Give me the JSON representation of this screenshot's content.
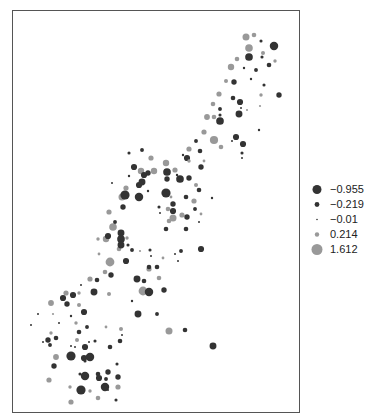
{
  "title": "",
  "colors": {
    "negative": "#333333",
    "positive": "#999999",
    "border": "#555555"
  },
  "chart_data": {
    "type": "scatter",
    "title": "",
    "subtitle": "",
    "xlabel": "",
    "ylabel": "",
    "grid": false,
    "legend_position": "right",
    "legend": [
      {
        "label": "−0.955",
        "value": -0.955,
        "r": 4.5,
        "color": "#333333"
      },
      {
        "label": "−0.219",
        "value": -0.219,
        "r": 2.4,
        "color": "#333333"
      },
      {
        "label": "−0.01",
        "value": -0.01,
        "r": 0.8,
        "color": "#333333"
      },
      {
        "label": "0.214",
        "value": 0.214,
        "r": 2.2,
        "color": "#999999"
      },
      {
        "label": "1.612",
        "value": 1.612,
        "r": 5.5,
        "color": "#999999"
      }
    ],
    "points": [
      {
        "x": 245,
        "y": 36,
        "v": 0.9
      },
      {
        "x": 253,
        "y": 34,
        "v": 0.5
      },
      {
        "x": 260,
        "y": 40,
        "v": -0.2
      },
      {
        "x": 273,
        "y": 45,
        "v": -0.9
      },
      {
        "x": 248,
        "y": 47,
        "v": 1.0
      },
      {
        "x": 262,
        "y": 52,
        "v": 0.4
      },
      {
        "x": 236,
        "y": 58,
        "v": 0.5
      },
      {
        "x": 248,
        "y": 56,
        "v": -0.8
      },
      {
        "x": 261,
        "y": 56,
        "v": -0.2
      },
      {
        "x": 274,
        "y": 60,
        "v": 0.3
      },
      {
        "x": 230,
        "y": 66,
        "v": 0.8
      },
      {
        "x": 243,
        "y": 67,
        "v": -0.1
      },
      {
        "x": 255,
        "y": 69,
        "v": -0.3
      },
      {
        "x": 268,
        "y": 64,
        "v": -0.4
      },
      {
        "x": 225,
        "y": 80,
        "v": 0.4
      },
      {
        "x": 233,
        "y": 81,
        "v": -0.5
      },
      {
        "x": 250,
        "y": 78,
        "v": -0.1
      },
      {
        "x": 263,
        "y": 84,
        "v": -0.2
      },
      {
        "x": 218,
        "y": 93,
        "v": 0.6
      },
      {
        "x": 232,
        "y": 97,
        "v": -0.4
      },
      {
        "x": 260,
        "y": 94,
        "v": 0.3
      },
      {
        "x": 278,
        "y": 94,
        "v": -0.5
      },
      {
        "x": 212,
        "y": 103,
        "v": 0.5
      },
      {
        "x": 219,
        "y": 108,
        "v": -0.3
      },
      {
        "x": 239,
        "y": 101,
        "v": -0.6
      },
      {
        "x": 259,
        "y": 105,
        "v": 0.1
      },
      {
        "x": 206,
        "y": 116,
        "v": 0.7
      },
      {
        "x": 213,
        "y": 116,
        "v": 0.5
      },
      {
        "x": 219,
        "y": 114,
        "v": -0.2
      },
      {
        "x": 219,
        "y": 120,
        "v": -0.8
      },
      {
        "x": 238,
        "y": 113,
        "v": -0.7
      },
      {
        "x": 240,
        "y": 107,
        "v": -0.05
      },
      {
        "x": 246,
        "y": 109,
        "v": 0.1
      },
      {
        "x": 203,
        "y": 131,
        "v": 0.6
      },
      {
        "x": 213,
        "y": 139,
        "v": 1.1
      },
      {
        "x": 220,
        "y": 146,
        "v": 0.5
      },
      {
        "x": 235,
        "y": 136,
        "v": -0.6
      },
      {
        "x": 231,
        "y": 140,
        "v": -0.05
      },
      {
        "x": 242,
        "y": 143,
        "v": -0.6
      },
      {
        "x": 258,
        "y": 129,
        "v": -0.1
      },
      {
        "x": 199,
        "y": 150,
        "v": -0.4
      },
      {
        "x": 203,
        "y": 160,
        "v": 0.2
      },
      {
        "x": 200,
        "y": 166,
        "v": -0.5
      },
      {
        "x": 241,
        "y": 152,
        "v": -0.2
      },
      {
        "x": 241,
        "y": 157,
        "v": -0.05
      },
      {
        "x": 195,
        "y": 140,
        "v": -0.3
      },
      {
        "x": 188,
        "y": 148,
        "v": 0.6
      },
      {
        "x": 186,
        "y": 157,
        "v": -0.6
      },
      {
        "x": 182,
        "y": 154,
        "v": -0.1
      },
      {
        "x": 165,
        "y": 162,
        "v": 0.8
      },
      {
        "x": 174,
        "y": 169,
        "v": 0.6
      },
      {
        "x": 176,
        "y": 174,
        "v": -0.1
      },
      {
        "x": 179,
        "y": 178,
        "v": -0.8
      },
      {
        "x": 188,
        "y": 177,
        "v": -0.5
      },
      {
        "x": 141,
        "y": 149,
        "v": -0.3
      },
      {
        "x": 150,
        "y": 157,
        "v": 0.6
      },
      {
        "x": 128,
        "y": 152,
        "v": -0.2
      },
      {
        "x": 133,
        "y": 166,
        "v": -0.6
      },
      {
        "x": 140,
        "y": 170,
        "v": 0.8
      },
      {
        "x": 153,
        "y": 170,
        "v": 0.8
      },
      {
        "x": 147,
        "y": 172,
        "v": -0.5
      },
      {
        "x": 143,
        "y": 174,
        "v": -0.6
      },
      {
        "x": 166,
        "y": 171,
        "v": -0.8
      },
      {
        "x": 188,
        "y": 160,
        "v": 0.3
      },
      {
        "x": 195,
        "y": 184,
        "v": 0.4
      },
      {
        "x": 198,
        "y": 189,
        "v": -0.4
      },
      {
        "x": 125,
        "y": 187,
        "v": 0.6
      },
      {
        "x": 138,
        "y": 184,
        "v": -0.6
      },
      {
        "x": 141,
        "y": 181,
        "v": -0.7
      },
      {
        "x": 166,
        "y": 178,
        "v": -0.5
      },
      {
        "x": 165,
        "y": 192,
        "v": -1.0
      },
      {
        "x": 128,
        "y": 175,
        "v": -0.1
      },
      {
        "x": 111,
        "y": 182,
        "v": -0.05
      },
      {
        "x": 121,
        "y": 196,
        "v": 0.9
      },
      {
        "x": 124,
        "y": 194,
        "v": -1.0
      },
      {
        "x": 147,
        "y": 190,
        "v": -0.1
      },
      {
        "x": 138,
        "y": 196,
        "v": -0.9
      },
      {
        "x": 170,
        "y": 196,
        "v": 0.2
      },
      {
        "x": 172,
        "y": 203,
        "v": -0.5
      },
      {
        "x": 185,
        "y": 196,
        "v": -0.4
      },
      {
        "x": 193,
        "y": 200,
        "v": 0.6
      },
      {
        "x": 194,
        "y": 208,
        "v": -0.3
      },
      {
        "x": 211,
        "y": 197,
        "v": -0.1
      },
      {
        "x": 200,
        "y": 213,
        "v": 0.2
      },
      {
        "x": 181,
        "y": 214,
        "v": 0.6
      },
      {
        "x": 186,
        "y": 216,
        "v": -0.5
      },
      {
        "x": 168,
        "y": 220,
        "v": 0.5
      },
      {
        "x": 165,
        "y": 228,
        "v": -0.4
      },
      {
        "x": 185,
        "y": 228,
        "v": -0.4
      },
      {
        "x": 198,
        "y": 221,
        "v": -0.05
      },
      {
        "x": 108,
        "y": 211,
        "v": 0.6
      },
      {
        "x": 122,
        "y": 206,
        "v": -0.5
      },
      {
        "x": 112,
        "y": 226,
        "v": 1.0
      },
      {
        "x": 114,
        "y": 221,
        "v": -0.3
      },
      {
        "x": 120,
        "y": 232,
        "v": -0.7
      },
      {
        "x": 126,
        "y": 237,
        "v": 0.3
      },
      {
        "x": 158,
        "y": 206,
        "v": -0.2
      },
      {
        "x": 159,
        "y": 212,
        "v": -0.05
      },
      {
        "x": 167,
        "y": 208,
        "v": 0.5
      },
      {
        "x": 172,
        "y": 210,
        "v": -0.6
      },
      {
        "x": 172,
        "y": 217,
        "v": 0.9
      },
      {
        "x": 105,
        "y": 238,
        "v": 0.8
      },
      {
        "x": 107,
        "y": 235,
        "v": -0.6
      },
      {
        "x": 120,
        "y": 238,
        "v": -0.8
      },
      {
        "x": 127,
        "y": 244,
        "v": -0.2
      },
      {
        "x": 97,
        "y": 238,
        "v": 0.3
      },
      {
        "x": 118,
        "y": 248,
        "v": 0.5
      },
      {
        "x": 131,
        "y": 249,
        "v": -0.3
      },
      {
        "x": 139,
        "y": 250,
        "v": 0.1
      },
      {
        "x": 149,
        "y": 249,
        "v": -0.2
      },
      {
        "x": 98,
        "y": 253,
        "v": 0.2
      },
      {
        "x": 120,
        "y": 244,
        "v": -0.7
      },
      {
        "x": 109,
        "y": 261,
        "v": 1.2
      },
      {
        "x": 125,
        "y": 260,
        "v": -0.6
      },
      {
        "x": 150,
        "y": 255,
        "v": -0.05
      },
      {
        "x": 162,
        "y": 257,
        "v": 0.2
      },
      {
        "x": 174,
        "y": 253,
        "v": -0.05
      },
      {
        "x": 180,
        "y": 250,
        "v": -0.3
      },
      {
        "x": 156,
        "y": 266,
        "v": -0.4
      },
      {
        "x": 148,
        "y": 268,
        "v": 0.6
      },
      {
        "x": 177,
        "y": 260,
        "v": -0.05
      },
      {
        "x": 200,
        "y": 248,
        "v": -0.6
      },
      {
        "x": 148,
        "y": 266,
        "v": -0.4
      },
      {
        "x": 104,
        "y": 271,
        "v": 0.5
      },
      {
        "x": 89,
        "y": 278,
        "v": 0.6
      },
      {
        "x": 96,
        "y": 279,
        "v": -0.4
      },
      {
        "x": 80,
        "y": 284,
        "v": -0.05
      },
      {
        "x": 110,
        "y": 274,
        "v": -0.5
      },
      {
        "x": 136,
        "y": 278,
        "v": -0.7
      },
      {
        "x": 142,
        "y": 290,
        "v": 1.2
      },
      {
        "x": 148,
        "y": 291,
        "v": -0.9
      },
      {
        "x": 163,
        "y": 289,
        "v": -0.5
      },
      {
        "x": 158,
        "y": 277,
        "v": 0.5
      },
      {
        "x": 143,
        "y": 280,
        "v": -0.4
      },
      {
        "x": 65,
        "y": 292,
        "v": 0.6
      },
      {
        "x": 72,
        "y": 294,
        "v": -0.6
      },
      {
        "x": 78,
        "y": 292,
        "v": 0.3
      },
      {
        "x": 66,
        "y": 303,
        "v": -0.5
      },
      {
        "x": 78,
        "y": 304,
        "v": 0.4
      },
      {
        "x": 83,
        "y": 311,
        "v": -0.6
      },
      {
        "x": 93,
        "y": 291,
        "v": -0.7
      },
      {
        "x": 108,
        "y": 293,
        "v": 0.4
      },
      {
        "x": 50,
        "y": 302,
        "v": 0.7
      },
      {
        "x": 62,
        "y": 297,
        "v": -0.6
      },
      {
        "x": 52,
        "y": 313,
        "v": 0.1
      },
      {
        "x": 58,
        "y": 322,
        "v": -0.05
      },
      {
        "x": 70,
        "y": 315,
        "v": -0.1
      },
      {
        "x": 75,
        "y": 322,
        "v": 0.3
      },
      {
        "x": 86,
        "y": 326,
        "v": -0.3
      },
      {
        "x": 78,
        "y": 331,
        "v": -0.4
      },
      {
        "x": 50,
        "y": 332,
        "v": 0.3
      },
      {
        "x": 105,
        "y": 326,
        "v": 0.2
      },
      {
        "x": 120,
        "y": 328,
        "v": 0.4
      },
      {
        "x": 137,
        "y": 313,
        "v": -0.7
      },
      {
        "x": 156,
        "y": 313,
        "v": -0.3
      },
      {
        "x": 131,
        "y": 300,
        "v": -0.1
      },
      {
        "x": 37,
        "y": 313,
        "v": -0.05
      },
      {
        "x": 30,
        "y": 324,
        "v": -0.05
      },
      {
        "x": 47,
        "y": 339,
        "v": -0.5
      },
      {
        "x": 55,
        "y": 337,
        "v": -0.4
      },
      {
        "x": 49,
        "y": 344,
        "v": -0.3
      },
      {
        "x": 42,
        "y": 341,
        "v": -0.05
      },
      {
        "x": 88,
        "y": 341,
        "v": -0.05
      },
      {
        "x": 121,
        "y": 334,
        "v": -0.05
      },
      {
        "x": 168,
        "y": 330,
        "v": 0.9
      },
      {
        "x": 184,
        "y": 329,
        "v": -0.4
      },
      {
        "x": 76,
        "y": 339,
        "v": 0.4
      },
      {
        "x": 212,
        "y": 345,
        "v": -0.7
      },
      {
        "x": 55,
        "y": 356,
        "v": 0.7
      },
      {
        "x": 74,
        "y": 346,
        "v": -0.05
      },
      {
        "x": 84,
        "y": 346,
        "v": -0.6
      },
      {
        "x": 94,
        "y": 340,
        "v": -0.2
      },
      {
        "x": 119,
        "y": 340,
        "v": -0.4
      },
      {
        "x": 70,
        "y": 355,
        "v": -0.5
      },
      {
        "x": 83,
        "y": 357,
        "v": -0.6
      },
      {
        "x": 109,
        "y": 346,
        "v": -0.4
      },
      {
        "x": 70,
        "y": 345,
        "v": -0.05
      },
      {
        "x": 53,
        "y": 365,
        "v": -0.5
      },
      {
        "x": 84,
        "y": 360,
        "v": -0.2
      },
      {
        "x": 84,
        "y": 375,
        "v": -0.9
      },
      {
        "x": 70,
        "y": 355,
        "v": -1.0
      },
      {
        "x": 89,
        "y": 356,
        "v": -0.9
      },
      {
        "x": 107,
        "y": 371,
        "v": -0.5
      },
      {
        "x": 116,
        "y": 363,
        "v": -0.2
      },
      {
        "x": 117,
        "y": 376,
        "v": -0.5
      },
      {
        "x": 97,
        "y": 373,
        "v": -0.4
      },
      {
        "x": 79,
        "y": 373,
        "v": -0.2
      },
      {
        "x": 80,
        "y": 389,
        "v": -1.0
      },
      {
        "x": 98,
        "y": 377,
        "v": -0.6
      },
      {
        "x": 104,
        "y": 386,
        "v": -0.9
      },
      {
        "x": 117,
        "y": 386,
        "v": 0.6
      },
      {
        "x": 105,
        "y": 378,
        "v": -0.3
      },
      {
        "x": 48,
        "y": 379,
        "v": 0.6
      },
      {
        "x": 69,
        "y": 386,
        "v": 0.3
      },
      {
        "x": 89,
        "y": 390,
        "v": 0.3
      },
      {
        "x": 107,
        "y": 389,
        "v": -0.05
      },
      {
        "x": 70,
        "y": 401,
        "v": 0.6
      },
      {
        "x": 97,
        "y": 397,
        "v": 0.5
      },
      {
        "x": 115,
        "y": 399,
        "v": -0.2
      }
    ]
  }
}
